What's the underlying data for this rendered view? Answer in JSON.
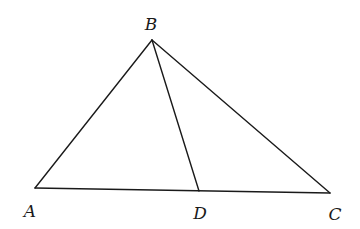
{
  "diagram": {
    "type": "geometry-triangle",
    "points": {
      "A": {
        "label": "A",
        "x": 35,
        "y": 188,
        "lx": 30,
        "ly": 217
      },
      "B": {
        "label": "B",
        "x": 152,
        "y": 40,
        "lx": 151,
        "ly": 30
      },
      "C": {
        "label": "C",
        "x": 330,
        "y": 193,
        "lx": 335,
        "ly": 220
      },
      "D": {
        "label": "D",
        "x": 199,
        "y": 191,
        "lx": 200,
        "ly": 219
      }
    },
    "segments": [
      {
        "name": "AB",
        "from": "A",
        "to": "B"
      },
      {
        "name": "BC",
        "from": "B",
        "to": "C"
      },
      {
        "name": "AC",
        "from": "A",
        "to": "C"
      },
      {
        "name": "BD",
        "from": "B",
        "to": "D"
      }
    ],
    "stroke_color": "#1a1a1a"
  }
}
